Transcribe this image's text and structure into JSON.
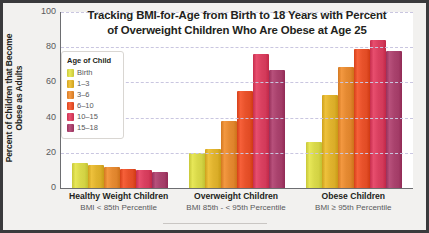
{
  "chart_data": {
    "type": "bar",
    "title": "Tracking BMI-for-Age from Birth to 18 Years with Percent of Overweight Children Who Are Obese at Age 25",
    "title_line1": "Tracking BMI-for-Age from Birth to 18 Years with Percent",
    "title_line2": "of Overweight Children Who Are Obese at Age 25",
    "xlabel": "",
    "ylabel": "Percent of Children that Become Obese as Adults",
    "ylim": [
      0,
      100
    ],
    "yticks": [
      0,
      20,
      40,
      60,
      80,
      100
    ],
    "ytick_labels": [
      "0",
      "20",
      "40",
      "60",
      "80",
      "100"
    ],
    "grid": true,
    "legend_position": "inside-upper-left",
    "legend_title": "Age of Child",
    "categories": [
      "Healthy Weight Children",
      "Overweight Children",
      "Obese Children"
    ],
    "category_sublabels": [
      "BMI < 85th Percentile",
      "BMI 85th - < 95th Percentile",
      "BMI ≥ 95th Percentile"
    ],
    "series": [
      {
        "name": "Birth",
        "color": "#d9d94a",
        "values": [
          14,
          20,
          26
        ]
      },
      {
        "name": "1–3",
        "color": "#e0b32e",
        "values": [
          13,
          22,
          53
        ]
      },
      {
        "name": "3–6",
        "color": "#e58a32",
        "values": [
          12,
          38,
          69
        ]
      },
      {
        "name": "6–10",
        "color": "#e8522b",
        "values": [
          11,
          55,
          79
        ]
      },
      {
        "name": "10–15",
        "color": "#d94060",
        "values": [
          10,
          76,
          84
        ]
      },
      {
        "name": "15–18",
        "color": "#a9426d",
        "values": [
          9,
          67,
          78
        ]
      }
    ]
  },
  "axis": {
    "y_title": "Percent of Children that Become Obese as Adults",
    "ticks": [
      {
        "label": "100",
        "value": 100
      },
      {
        "label": "80",
        "value": 80
      },
      {
        "label": "60",
        "value": 60
      },
      {
        "label": "40",
        "value": 40
      },
      {
        "label": "20",
        "value": 20
      },
      {
        "label": "0",
        "value": 0
      }
    ]
  },
  "legend": {
    "title": "Age of Child",
    "items": [
      {
        "label": "Birth",
        "color": "#d9d94a"
      },
      {
        "label": "1–3",
        "color": "#e0b32e"
      },
      {
        "label": "3–6",
        "color": "#e58a32"
      },
      {
        "label": "6–10",
        "color": "#e8522b"
      },
      {
        "label": "10–15",
        "color": "#d94060"
      },
      {
        "label": "15–18",
        "color": "#a9426d"
      }
    ]
  }
}
